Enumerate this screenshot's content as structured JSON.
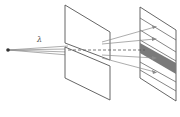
{
  "diagram": {
    "wavelength_label": "λ",
    "elements": [
      "point-source",
      "slit-screen",
      "observation-screen"
    ],
    "colors": {
      "line": "#555555",
      "ray": "#8a8a8a",
      "dark_band": "#7a7a7a",
      "background": "#ffffff"
    }
  }
}
